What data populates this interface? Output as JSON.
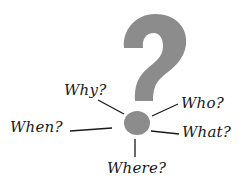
{
  "illustration": {
    "symbol": "question-mark",
    "symbol_color": "#8c8c8c",
    "line_color": "#1a1a1a",
    "labels": {
      "why": "Why?",
      "who": "Who?",
      "when": "When?",
      "what": "What?",
      "where": "Where?"
    }
  }
}
